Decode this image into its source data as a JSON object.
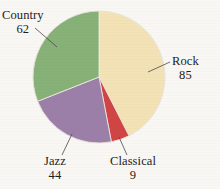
{
  "background_color": "#f8f7f4",
  "chart_data": {
    "type": "pie",
    "title": "",
    "subtitle": "",
    "xlabel": "",
    "ylabel": "",
    "total": 200,
    "legend_position": "none",
    "grid": false,
    "labels_style": "external labels with leader lines",
    "categories": [
      "Rock",
      "Classical",
      "Jazz",
      "Country"
    ],
    "values": [
      85,
      9,
      44,
      62
    ],
    "colors": [
      "#f2e2b5",
      "#d04444",
      "#9b7fa8",
      "#86b177"
    ],
    "start_angle_deg": 0,
    "direction": "clockwise",
    "slices": [
      {
        "name": "Rock",
        "value": 85,
        "color": "#f2e2b5",
        "angle_deg": 153.0,
        "percent": 42.5,
        "label_text": "Rock",
        "value_text": "85"
      },
      {
        "name": "Classical",
        "value": 9,
        "color": "#d04444",
        "angle_deg": 16.2,
        "percent": 4.5,
        "label_text": "Classical",
        "value_text": "9"
      },
      {
        "name": "Jazz",
        "value": 44,
        "color": "#9b7fa8",
        "angle_deg": 79.2,
        "percent": 22.0,
        "label_text": "Jazz",
        "value_text": "44"
      },
      {
        "name": "Country",
        "value": 62,
        "color": "#86b177",
        "angle_deg": 111.6,
        "percent": 31.0,
        "label_text": "Country",
        "value_text": "62"
      }
    ]
  },
  "labels": {
    "country": {
      "name": "Country",
      "value": "62"
    },
    "rock": {
      "name": "Rock",
      "value": "85"
    },
    "jazz": {
      "name": "Jazz",
      "value": "44"
    },
    "classical": {
      "name": "Classical",
      "value": "9"
    }
  }
}
